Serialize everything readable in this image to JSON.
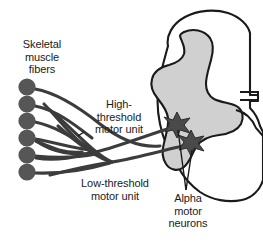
{
  "figure": {
    "background_color": "#ffffff",
    "stroke_color": "#1a1a1a",
    "gray_matter_color": "#d0d0d0",
    "fiber_color": "#565656",
    "axon_color": "#3c3c3c"
  },
  "labels": {
    "skeletal": {
      "lines": [
        "Skeletal",
        "muscle",
        "fibers"
      ],
      "line1": "Skeletal",
      "line2": "muscle",
      "line3": "fibers"
    },
    "high_threshold": {
      "lines": [
        "High-",
        "threshold",
        "motor unit"
      ],
      "line1": "High-",
      "line2": "threshold",
      "line3": "motor unit"
    },
    "low_threshold": {
      "lines": [
        "Low-threshold",
        "motor unit"
      ],
      "line1": "Low-threshold",
      "line2": "motor unit"
    },
    "alpha_motor_neurons": {
      "lines": [
        "Alpha",
        "motor",
        "neurons"
      ],
      "line1": "Alpha",
      "line2": "motor",
      "line3": "neurons"
    }
  },
  "muscle_fibers": {
    "count": 6,
    "items": [
      {
        "name": "muscle-fiber-1",
        "cx": 27,
        "cy": 87,
        "r": 8.5
      },
      {
        "name": "muscle-fiber-2",
        "cx": 27,
        "cy": 104,
        "r": 8.5
      },
      {
        "name": "muscle-fiber-3",
        "cx": 27,
        "cy": 121,
        "r": 8.5
      },
      {
        "name": "muscle-fiber-4",
        "cx": 27,
        "cy": 138,
        "r": 8.5
      },
      {
        "name": "muscle-fiber-5",
        "cx": 27,
        "cy": 155,
        "r": 8.5
      },
      {
        "name": "muscle-fiber-6",
        "cx": 27,
        "cy": 172,
        "r": 8.5
      }
    ]
  },
  "motor_neurons": {
    "count": 2,
    "items": [
      {
        "name": "alpha-motor-neuron-high-threshold",
        "cx": 177,
        "cy": 124,
        "type": "high-threshold"
      },
      {
        "name": "alpha-motor-neuron-low-threshold",
        "cx": 191,
        "cy": 142,
        "type": "low-threshold"
      }
    ]
  },
  "anatomy": {
    "structure": "spinal-cord-cross-section",
    "regions": [
      "white-matter",
      "gray-matter-butterfly",
      "ventral-root"
    ]
  }
}
